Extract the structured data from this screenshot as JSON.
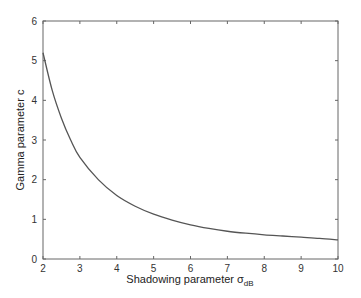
{
  "chart_data": {
    "type": "line",
    "title": "",
    "xlabel": "Shadowing parameter σ",
    "xlabel_subscript": "dB",
    "ylabel": "Gamma parameter c",
    "xlim": [
      2,
      10
    ],
    "ylim": [
      0,
      6
    ],
    "xticks": [
      2,
      3,
      4,
      5,
      6,
      7,
      8,
      9,
      10
    ],
    "yticks": [
      0,
      1,
      2,
      3,
      4,
      5,
      6
    ],
    "grid": false,
    "legend": null,
    "series": [
      {
        "name": "c",
        "color": "#555555",
        "x": [
          2.0,
          2.25,
          2.5,
          2.75,
          3.0,
          3.5,
          4.0,
          4.5,
          5.0,
          5.5,
          6.0,
          6.5,
          7.0,
          7.5,
          8.0,
          8.5,
          9.0,
          9.5,
          10.0
        ],
        "y": [
          5.2,
          4.25,
          3.55,
          3.0,
          2.56,
          2.0,
          1.6,
          1.33,
          1.13,
          0.98,
          0.86,
          0.77,
          0.7,
          0.65,
          0.61,
          0.58,
          0.55,
          0.52,
          0.48
        ]
      }
    ]
  }
}
